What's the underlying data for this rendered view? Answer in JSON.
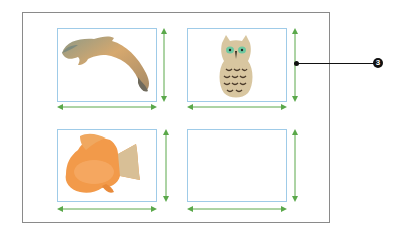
{
  "figure": {
    "colors": {
      "frame": "#8a8a8a",
      "cell_border": "#9fcbe8",
      "dimension_arrow": "#5aa84a",
      "callout": "#111111"
    },
    "cells": [
      {
        "position": "top-left",
        "content": "wooden dolphin figurine",
        "icon": "dolphin-image"
      },
      {
        "position": "top-right",
        "content": "wooden owl figurine",
        "icon": "owl-image"
      },
      {
        "position": "bottom-left",
        "content": "wooden orange fish figurine",
        "icon": "fish-image"
      },
      {
        "position": "bottom-right",
        "content": "empty placeholder",
        "icon": "empty-frame"
      }
    ],
    "callout": {
      "number": "3",
      "points_to": "top-right cell height dimension"
    }
  }
}
